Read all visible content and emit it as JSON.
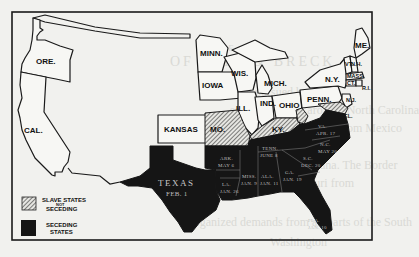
{
  "map": {
    "subject": "Secession of the Southern States, 1860-1861",
    "legend": {
      "slave_not_seceding": {
        "line1": "SLAVE STATES",
        "line2": "NOT",
        "line3": "SECEDING",
        "pattern": "hatched"
      },
      "seceding": {
        "line1": "SECEDING",
        "line2": "STATES",
        "color": "#151515"
      }
    },
    "free_states": {
      "ore": "ORE.",
      "cal": "CAL.",
      "kansas": "KANSAS",
      "minn": "MINN.",
      "iowa": "IOWA",
      "wis": "WIS.",
      "ill": "ILL.",
      "mich": "MICH.",
      "ind": "IND.",
      "ohio": "OHIO",
      "penn": "PENN.",
      "ny": "N.Y.",
      "nj": "N.J.",
      "me": "ME.",
      "vt": "VT.",
      "nh": "N.H.",
      "mass": "MASS.",
      "ct": "CT.",
      "ri": "R.I."
    },
    "slave_not_seceding_states": {
      "mo": "MO.",
      "ky": "KY.",
      "md": "MD.",
      "del": "DEL.",
      "wva": "W.VA."
    },
    "seceding_states": {
      "texas": {
        "name": "TEXAS",
        "date": "FEB. 1"
      },
      "ark": {
        "name": "ARK.",
        "date": "MAY 6"
      },
      "la": {
        "name": "LA.",
        "date": "JAN. 26"
      },
      "miss": {
        "name": "MISS.",
        "date": "JAN. 9"
      },
      "ala": {
        "name": "ALA.",
        "date": "JAN. 11"
      },
      "ga": {
        "name": "GA.",
        "date": "JAN. 19"
      },
      "fla": {
        "name": "FLA.",
        "date": "JAN. 10"
      },
      "tenn": {
        "name": "TENN.",
        "date": "JUNE 8"
      },
      "va": {
        "name": "VA.",
        "date": "APR. 17"
      },
      "nc": {
        "name": "N.C.",
        "date": "MAY 20"
      },
      "sc": {
        "name": "S.C.",
        "date": "DEC. 20"
      }
    },
    "colors": {
      "frame": "#1a1a1a",
      "free": "#f7f7f4",
      "seceding": "#151515",
      "background": "#f1f1ee"
    }
  },
  "background_page_text": {
    "l1": "T H E",
    "l2": "OF BELL & BRECK",
    "l3": "THE plan pursued by the",
    "l4": "secede: South Carolina, North Carolina",
    "l5": "Texas, Florida, Georgia, from Mexico",
    "l6": "Alabama, Louisiana. The Border",
    "l7": "states and Missouri from",
    "l8": "organized demands from all parts of the South",
    "l9": "Washington"
  }
}
